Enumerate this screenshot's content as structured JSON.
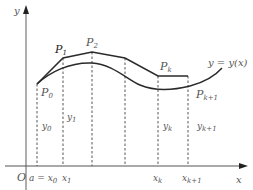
{
  "diagram": {
    "axes": {
      "x_label": "x",
      "y_label": "y",
      "origin_label": "O"
    },
    "curve_label": {
      "main": "y = y(x)"
    },
    "points": [
      {
        "name": "P",
        "sub": "0"
      },
      {
        "name": "P",
        "sub": "1"
      },
      {
        "name": "P",
        "sub": "2"
      },
      {
        "name": "P",
        "sub": "k"
      },
      {
        "name": "P",
        "sub": "k+1"
      }
    ],
    "x_ticks": [
      {
        "text": "a = x",
        "sub": "0"
      },
      {
        "text": "x",
        "sub": "1"
      },
      {
        "text": "x",
        "sub": "k"
      },
      {
        "text": "x",
        "sub": "k+1"
      }
    ],
    "ordinates": [
      {
        "text": "y",
        "sub": "0"
      },
      {
        "text": "y",
        "sub": "1"
      },
      {
        "text": "y",
        "sub": "k"
      },
      {
        "text": "y",
        "sub": "k+1"
      }
    ],
    "colors": {
      "line": "#2a2a2a",
      "axis": "#333333",
      "dashed": "#444444",
      "text": "#555555"
    }
  }
}
